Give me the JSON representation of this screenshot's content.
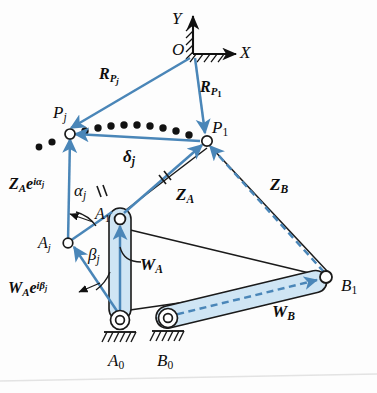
{
  "figure": {
    "type": "kinematic-diagram",
    "colors": {
      "vector_blue": "#4a86b8",
      "link_fill": "#cfe5f4",
      "outline_black": "#1a1a1a",
      "background": "#fdfdfd"
    }
  },
  "axes": {
    "origin_label": "O",
    "y_label": "Y",
    "x_label": "X"
  },
  "points": {
    "O": "O",
    "P1": "P",
    "P1_sub": "1",
    "Pj": "P",
    "Pj_sub": "j",
    "A1": "A",
    "A1_sub": "1",
    "Aj": "A",
    "Aj_sub": "j",
    "A0": "A",
    "A0_sub": "0",
    "B1": "B",
    "B1_sub": "1",
    "B0": "B",
    "B0_sub": "0"
  },
  "vectors": [
    {
      "name": "R_Pj",
      "base": "R",
      "sub": "P",
      "subsub": "j",
      "style": "solid-blue",
      "from": "O",
      "to": "Pj"
    },
    {
      "name": "R_P1",
      "base": "R",
      "sub": "P",
      "subsub": "1",
      "style": "solid-blue",
      "from": "O",
      "to": "P1"
    },
    {
      "name": "delta_j",
      "base": "δ",
      "sub": "j",
      "style": "solid-blue",
      "from": "P1",
      "to": "Pj"
    },
    {
      "name": "Z_A",
      "base": "Z",
      "sub": "A",
      "style": "solid-blue",
      "from": "A1",
      "to": "P1"
    },
    {
      "name": "Z_B",
      "base": "Z",
      "sub": "B",
      "style": "dashed-blue",
      "from": "B1",
      "to": "P1"
    },
    {
      "name": "W_A",
      "base": "W",
      "sub": "A",
      "style": "solid-blue",
      "from": "A0",
      "to": "A1"
    },
    {
      "name": "W_B",
      "base": "W",
      "sub": "B",
      "style": "dashed-blue",
      "from": "B0",
      "to": "B1"
    },
    {
      "name": "Z_A_rot",
      "base": "Z",
      "sub": "A",
      "exp": "e",
      "exp_sup": "iα",
      "exp_sup_sub": "j",
      "style": "solid-blue",
      "from": "Aj",
      "to": "Pj"
    },
    {
      "name": "W_A_rot",
      "base": "W",
      "sub": "A",
      "exp": "e",
      "exp_sup": "iβ",
      "exp_sup_sub": "j",
      "style": "solid-blue",
      "from": "A0",
      "to": "Aj"
    }
  ],
  "labels": {
    "R_Pj": {
      "base": "R",
      "sub": "P",
      "subsub": "j"
    },
    "R_P1": {
      "base": "R",
      "sub": "P",
      "subsub": "1"
    },
    "delta_j": {
      "base": "δ",
      "sub": "j"
    },
    "Z_A": {
      "base": "Z",
      "sub": "A"
    },
    "Z_B": {
      "base": "Z",
      "sub": "B"
    },
    "W_A": {
      "base": "W",
      "sub": "A"
    },
    "W_B": {
      "base": "W",
      "sub": "B"
    },
    "alpha_j": {
      "base": "α",
      "sub": "j"
    },
    "beta_j": {
      "base": "β",
      "sub": "j"
    },
    "ZA_exp": {
      "base": "Z",
      "sub": "A",
      "e": "e",
      "sup": "iα",
      "supsub": "j"
    },
    "WA_exp": {
      "base": "W",
      "sub": "A",
      "e": "e",
      "sup": "iβ",
      "supsub": "j"
    }
  },
  "annotations": {
    "coupler_curve": "dotted path of coupler point P from P1 to Pj",
    "tick_marks": "equal-length hash marks on Z_A and Z_A e^(i alpha_j)",
    "ground_symbols": "hatched fixed-pivot ground at A0 and B0 and at origin O"
  }
}
